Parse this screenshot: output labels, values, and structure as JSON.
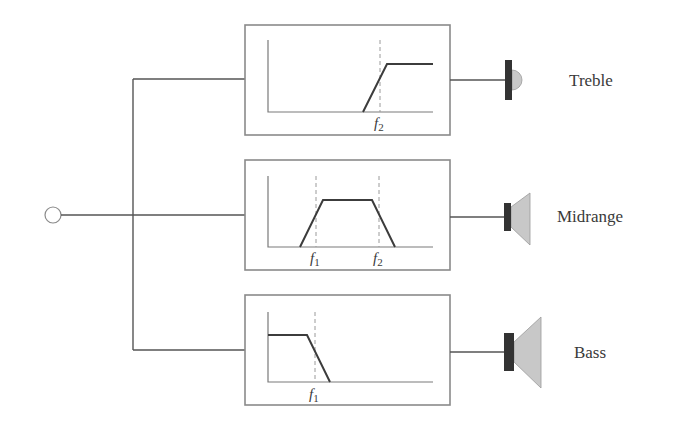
{
  "diagram": {
    "input": {
      "label": "",
      "cx": 53,
      "cy": 215,
      "r": 8
    },
    "colors": {
      "wire": "#555555",
      "box_border": "#8a8a8a",
      "curve": "#3c3c3c",
      "magnet": "#333333",
      "cone": "#c8c8c8",
      "text": "#3a3a3a"
    },
    "channels": [
      {
        "name": "Treble",
        "filter_type": "high-pass",
        "driver": "tweeter",
        "cutoffs": [
          {
            "symbol": "f",
            "sub": "2"
          }
        ]
      },
      {
        "name": "Midrange",
        "filter_type": "band-pass",
        "driver": "midrange",
        "cutoffs": [
          {
            "symbol": "f",
            "sub": "1"
          },
          {
            "symbol": "f",
            "sub": "2"
          }
        ]
      },
      {
        "name": "Bass",
        "filter_type": "low-pass",
        "driver": "woofer",
        "cutoffs": [
          {
            "symbol": "f",
            "sub": "1"
          }
        ]
      }
    ]
  }
}
